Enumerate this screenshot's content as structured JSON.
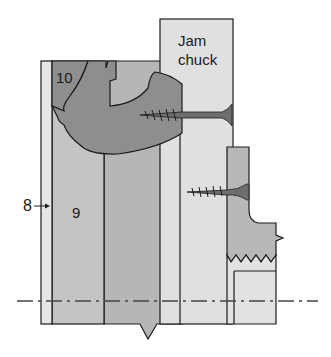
{
  "diagram": {
    "type": "woodturning cross-section",
    "labels": {
      "part_8": "8",
      "part_9": "9",
      "part_10": "10",
      "jam_chuck_line1": "Jam",
      "jam_chuck_line2": "chuck"
    },
    "colors": {
      "outline": "#1c1c1c",
      "strip_8": "#e6e6e6",
      "block_9": "#c4c4c4",
      "block_right": "#b6b6b6",
      "workpiece_10": "#8e8e8e",
      "jam_chuck": "#e0e0e0",
      "small_piece": "#b8b8b8",
      "small_piece_lower": "#e2e2e2",
      "screw": "#6e6e6e",
      "centerline": "#444444"
    },
    "elements": [
      "strip 8",
      "block 9",
      "workpiece 10",
      "jam chuck",
      "two screws",
      "centerline (dash-dot)",
      "break marks (zigzag)"
    ]
  }
}
